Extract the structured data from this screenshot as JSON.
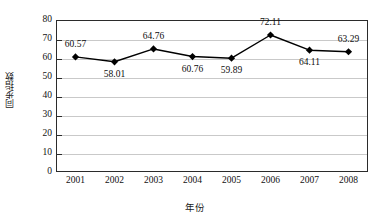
{
  "chart_data": {
    "type": "line",
    "title": "",
    "subtitle": "",
    "xlabel": "年份",
    "ylabel": "同步指数",
    "categories": [
      "2001",
      "2002",
      "2003",
      "2004",
      "2005",
      "2006",
      "2007",
      "2008"
    ],
    "values": [
      60.57,
      58.01,
      64.76,
      60.76,
      59.89,
      72.11,
      64.11,
      63.29
    ],
    "point_labels": [
      "60.57",
      "58.01",
      "64.76",
      "60.76",
      "59.89",
      "72.11",
      "64.11",
      "63.29"
    ],
    "label_positions": [
      "above",
      "below",
      "above",
      "below",
      "below",
      "above",
      "below",
      "above"
    ],
    "ylim": [
      0,
      80
    ],
    "ytick_labels": [
      "0",
      "10",
      "20",
      "30",
      "40",
      "50",
      "60",
      "70",
      "80"
    ],
    "ytick_values": [
      0,
      10,
      20,
      30,
      40,
      50,
      60,
      70,
      80
    ],
    "grid": true,
    "grid_axis": "y",
    "legend": false,
    "legend_position": "none",
    "series": [
      {
        "name": "同步指数",
        "values": [
          60.57,
          58.01,
          64.76,
          60.76,
          59.89,
          72.11,
          64.11,
          63.29
        ],
        "marker": "diamond",
        "line_color": "#000000",
        "marker_color": "#000000"
      }
    ],
    "colors": {
      "line": "#000000",
      "marker": "#000000",
      "gridline": "#c9c9c9",
      "axis": "#2b2b2b",
      "background": "#ffffff",
      "text": "#111111"
    }
  }
}
